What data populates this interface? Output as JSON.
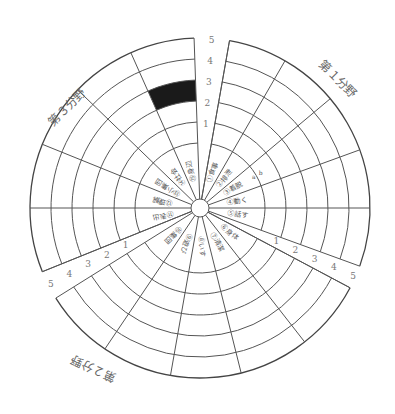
{
  "diagram": {
    "center": [
      200,
      208
    ],
    "hub_radius": 9,
    "label_ring_radius": 65,
    "level_radii": [
      86,
      107,
      128,
      149,
      170
    ],
    "scale_labels": [
      "1",
      "2",
      "3",
      "4",
      "5"
    ],
    "fields": [
      {
        "label": "第１分野",
        "start_deg": -80,
        "end_deg": 20
      },
      {
        "label": "第２分野",
        "start_deg": 28,
        "end_deg": 148
      },
      {
        "label": "第３分野",
        "start_deg": 158,
        "end_deg": 268
      }
    ],
    "items": [
      "①食事",
      "②排泄",
      "③着脱",
      "④動く",
      "⑤話す",
      "⑥身体",
      "⑦清潔",
      "⑧いす",
      "⑨遊び",
      "⑩集団",
      "⑪表出",
      "⑫理解",
      "⑬小集団",
      "⑭社会",
      "⑮身辺"
    ],
    "sub_marks": [
      "a",
      "b"
    ],
    "highlight": {
      "sector_index": 14,
      "level": 3,
      "color": "#1a1a1a"
    },
    "line_color": "#555555"
  }
}
